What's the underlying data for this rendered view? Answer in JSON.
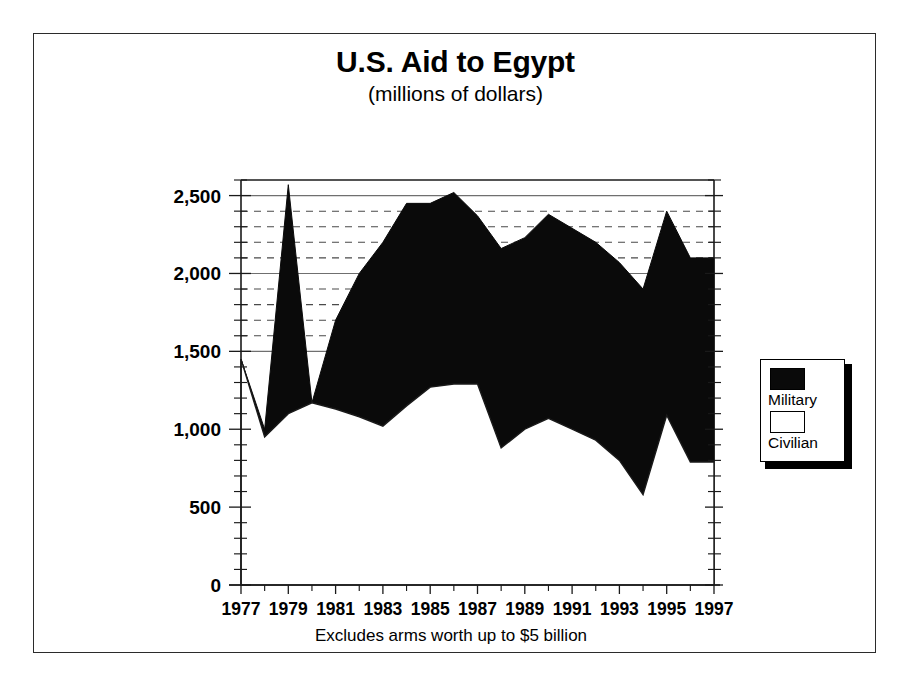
{
  "figure": {
    "title": "U.S. Aid to Egypt",
    "subtitle": "(millions of dollars)"
  },
  "legend": {
    "military_label": "Military",
    "civilian_label": "Civilian",
    "military_color": "#0a0a0a",
    "civilian_color": "#ffffff"
  },
  "axes": {
    "y_ticks": [
      "0",
      "500",
      "1,000",
      "1,500",
      "2,000",
      "2,500"
    ],
    "x_ticks": [
      "1977",
      "1979",
      "1981",
      "1983",
      "1985",
      "1987",
      "1989",
      "1991",
      "1993",
      "1995",
      "1997"
    ],
    "footnote": "Excludes arms worth up to $5 billion"
  },
  "chart_data": {
    "type": "area",
    "stacked": true,
    "title": "U.S. Aid to Egypt",
    "subtitle": "(millions of dollars)",
    "xlabel": "",
    "ylabel": "",
    "note": "Excludes arms worth up to $5 billion",
    "units": "millions of dollars",
    "grid": true,
    "legend_position": "right",
    "xlim": [
      1977,
      1997
    ],
    "ylim": [
      0,
      2600
    ],
    "y_major_step": 500,
    "y_minor_step": 100,
    "x_tick_step": 2,
    "x": [
      1977,
      1978,
      1979,
      1980,
      1981,
      1982,
      1983,
      1984,
      1985,
      1986,
      1987,
      1988,
      1989,
      1990,
      1991,
      1992,
      1993,
      1994,
      1995,
      1996,
      1997
    ],
    "categories": [
      "1977",
      "1978",
      "1979",
      "1980",
      "1981",
      "1982",
      "1983",
      "1984",
      "1985",
      "1986",
      "1987",
      "1988",
      "1989",
      "1990",
      "1991",
      "1992",
      "1993",
      "1994",
      "1995",
      "1996",
      "1997"
    ],
    "series": [
      {
        "name": "Civilian",
        "color": "#ffffff",
        "values": [
          1450,
          950,
          1100,
          1170,
          1130,
          1080,
          1020,
          1150,
          1270,
          1290,
          1290,
          880,
          1000,
          1070,
          1000,
          930,
          800,
          580,
          1090,
          790,
          790
        ]
      },
      {
        "name": "Military",
        "color": "#0a0a0a",
        "values": [
          0,
          50,
          1470,
          0,
          570,
          920,
          1180,
          1300,
          1180,
          1230,
          1080,
          1280,
          1230,
          1310,
          1290,
          1270,
          1270,
          1320,
          1310,
          1310,
          1310
        ]
      }
    ],
    "totals": [
      1450,
      1000,
      2570,
      1170,
      1700,
      2000,
      2200,
      2450,
      2450,
      2520,
      2370,
      2160,
      2230,
      2380,
      2290,
      2200,
      2070,
      1900,
      2400,
      2100,
      2100
    ]
  }
}
